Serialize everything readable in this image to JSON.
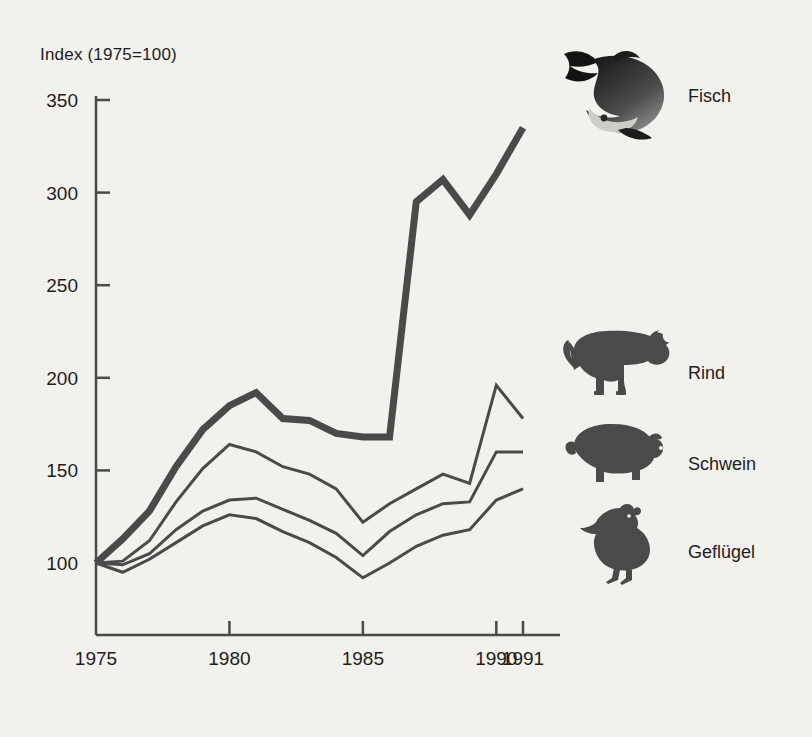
{
  "figure": {
    "background_color": "#f2f1ed",
    "ink_color": "#4a4a4a",
    "text_color": "#1d1d1d",
    "axis_title": "Index (1975=100)"
  },
  "legend": {
    "position": "right",
    "entries": [
      {
        "label": "Fisch",
        "icon": "fish-icon",
        "series": "Fisch"
      },
      {
        "label": "Rind",
        "icon": "bull-icon",
        "series": "Rind"
      },
      {
        "label": "Schwein",
        "icon": "pig-icon",
        "series": "Schwein"
      },
      {
        "label": "Geflügel",
        "icon": "chicken-icon",
        "series": "Geflügel"
      }
    ]
  },
  "chart_data": {
    "type": "line",
    "title": "Index (1975=100)",
    "xlabel": "",
    "ylabel": "Index (1975=100)",
    "xlim": [
      1975,
      1991
    ],
    "ylim": [
      75,
      355
    ],
    "grid": false,
    "legend_position": "right",
    "x": [
      1975,
      1976,
      1977,
      1978,
      1979,
      1980,
      1981,
      1982,
      1983,
      1984,
      1985,
      1986,
      1987,
      1988,
      1989,
      1990,
      1991
    ],
    "xticks": [
      1975,
      1980,
      1985,
      1990,
      1991
    ],
    "xtick_labels": [
      "1975",
      "1980",
      "1985",
      "1990",
      "1991"
    ],
    "yticks": [
      100,
      150,
      200,
      250,
      300,
      350
    ],
    "ytick_labels": [
      "100",
      "150",
      "200",
      "250",
      "300",
      "350"
    ],
    "series": [
      {
        "name": "Fisch",
        "emphasis": "thick",
        "linewidth": 7,
        "values": [
          100,
          113,
          128,
          152,
          172,
          185,
          192,
          178,
          177,
          170,
          168,
          168,
          295,
          307,
          288,
          310,
          335
        ]
      },
      {
        "name": "Rind",
        "emphasis": "thin",
        "linewidth": 3,
        "values": [
          100,
          101,
          112,
          133,
          151,
          164,
          160,
          152,
          148,
          140,
          122,
          132,
          140,
          148,
          143,
          196,
          178
        ]
      },
      {
        "name": "Schwein",
        "emphasis": "thin",
        "linewidth": 3,
        "values": [
          100,
          99,
          105,
          118,
          128,
          134,
          135,
          129,
          123,
          116,
          104,
          117,
          126,
          132,
          133,
          160,
          160
        ]
      },
      {
        "name": "Geflügel",
        "emphasis": "thin",
        "linewidth": 3,
        "values": [
          100,
          95,
          102,
          111,
          120,
          126,
          124,
          117,
          111,
          103,
          92,
          100,
          109,
          115,
          118,
          134,
          140
        ]
      }
    ]
  }
}
